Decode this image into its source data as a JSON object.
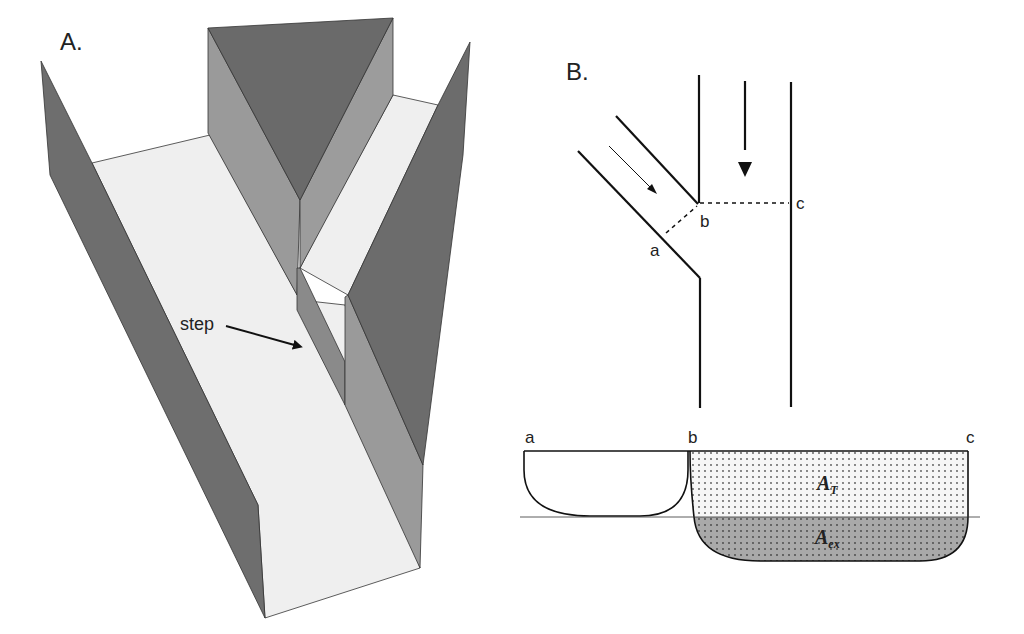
{
  "figure": {
    "panel_a": {
      "label": "A.",
      "annotation": "step",
      "colors": {
        "floor": "#efefef",
        "dark_wall": "#6e6e6e",
        "mid_wall": "#9a9a9a",
        "wedge_top": "#6a6a6a",
        "edge": "#333333"
      }
    },
    "panel_b": {
      "label": "B.",
      "plan_points": {
        "a": "a",
        "b": "b",
        "c": "c"
      },
      "section_points": {
        "a": "a",
        "b": "b",
        "c": "c"
      },
      "areas": {
        "total": {
          "symbol": "A",
          "subscript": "T"
        },
        "exchange": {
          "symbol": "A",
          "subscript": "ex"
        }
      },
      "colors": {
        "stipple_fill": "#f4f4f4",
        "shaded_fill": "#a8a8a8",
        "line": "#1a1a1a"
      }
    }
  }
}
